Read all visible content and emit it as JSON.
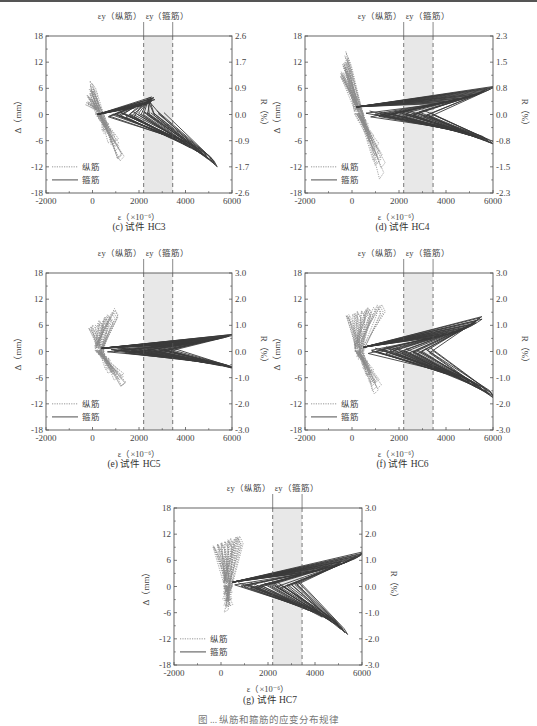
{
  "figure_caption": "图 ... 纵筋和箍筋的应变分布规律",
  "legend": {
    "long": "纵筋",
    "stirrup": "箍筋"
  },
  "annotations": {
    "yield_long": "εy（纵筋）",
    "yield_stirrup": "εy（箍筋）"
  },
  "axis_labels": {
    "x": "ε（×10⁻⁶）",
    "y_left": "Δ（mm）",
    "y_right": "R（%）"
  },
  "colors": {
    "stirrup": "#3a3a3a",
    "long": "#8a8a8a",
    "band": "#e8e8e8",
    "frame": "#555555"
  },
  "chart_data": [
    {
      "id": "c",
      "type": "line",
      "title": "(c) 试件 HC3",
      "xlabel": "ε（×10⁻⁶）",
      "ylabel": "Δ（mm）",
      "ylabel_right": "R（%）",
      "xlim": [
        -2000,
        6000
      ],
      "ylim": [
        -18,
        18
      ],
      "xticks": [
        -2000,
        0,
        2000,
        4000,
        6000
      ],
      "yticks": [
        -18,
        -12,
        -6,
        0,
        6,
        12,
        18
      ],
      "yticks_right": [
        "-2.6",
        "-1.7",
        "-0.9",
        "0.0",
        "0.9",
        "1.7",
        "2.6"
      ],
      "yield_lines": {
        "long": 2200,
        "stirrup": 3450
      },
      "series": [
        {
          "name": "纵筋",
          "style": "dotted",
          "envelope": [
            [
              -300,
              2
            ],
            [
              0,
              8
            ],
            [
              800,
              12
            ],
            [
              1200,
              -12
            ],
            [
              2000,
              -8
            ],
            [
              500,
              -2
            ]
          ]
        },
        {
          "name": "箍筋",
          "style": "solid",
          "envelope": [
            [
              200,
              0
            ],
            [
              2500,
              4
            ],
            [
              5600,
              12
            ],
            [
              5200,
              -12
            ],
            [
              3000,
              -8
            ],
            [
              600,
              0
            ]
          ]
        }
      ]
    },
    {
      "id": "d",
      "type": "line",
      "title": "(d) 试件 HC4",
      "xlabel": "ε（×10⁻⁶）",
      "ylabel": "Δ（mm）",
      "ylabel_right": "R（%）",
      "xlim": [
        -2000,
        6000
      ],
      "ylim": [
        -18,
        18
      ],
      "xticks": [
        -2000,
        0,
        2000,
        4000,
        6000
      ],
      "yticks": [
        -18,
        -12,
        -6,
        0,
        6,
        12,
        18
      ],
      "yticks_right": [
        "-2.3",
        "-1.5",
        "-0.8",
        "0.0",
        "0.8",
        "1.5",
        "2.3"
      ],
      "yield_lines": {
        "long": 2200,
        "stirrup": 3450
      },
      "series": [
        {
          "name": "纵筋",
          "style": "dotted",
          "envelope": [
            [
              -500,
              8
            ],
            [
              -200,
              15
            ],
            [
              200,
              -2
            ],
            [
              1200,
              -15
            ],
            [
              2200,
              -10
            ]
          ]
        },
        {
          "name": "箍筋",
          "style": "solid",
          "envelope": [
            [
              200,
              3.5
            ],
            [
              6000,
              6.5
            ],
            [
              3200,
              0
            ],
            [
              6000,
              -7
            ],
            [
              3600,
              -6
            ],
            [
              1500,
              -4
            ]
          ]
        }
      ]
    },
    {
      "id": "e",
      "type": "line",
      "title": "(e) 试件 HC5",
      "xlabel": "ε（×10⁻⁶）",
      "ylabel": "Δ（mm）",
      "ylabel_right": "R（%）",
      "xlim": [
        -2000,
        6000
      ],
      "ylim": [
        -18,
        18
      ],
      "xticks": [
        -2000,
        0,
        2000,
        4000,
        6000
      ],
      "yticks": [
        -18,
        -12,
        -6,
        0,
        6,
        12,
        18
      ],
      "yticks_right": [
        "-3.0",
        "-2.0",
        "-1.0",
        "0.0",
        "1.0",
        "2.0",
        "3.0"
      ],
      "yield_lines": {
        "long": 2200,
        "stirrup": 3450
      },
      "series": [
        {
          "name": "纵筋",
          "style": "dotted",
          "envelope": [
            [
              -200,
              5
            ],
            [
              1000,
              10
            ],
            [
              1900,
              -7
            ],
            [
              1300,
              -10
            ],
            [
              300,
              -2
            ]
          ]
        },
        {
          "name": "箍筋",
          "style": "solid",
          "envelope": [
            [
              400,
              1.5
            ],
            [
              6000,
              4
            ],
            [
              6000,
              -4
            ],
            [
              5400,
              -4
            ],
            [
              800,
              0
            ]
          ]
        }
      ]
    },
    {
      "id": "f",
      "type": "line",
      "title": "(f) 试件 HC6",
      "xlabel": "ε（×10⁻⁶）",
      "ylabel": "Δ（mm）",
      "ylabel_right": "R（%）",
      "xlim": [
        -2000,
        6000
      ],
      "ylim": [
        -18,
        18
      ],
      "xticks": [
        -2000,
        0,
        2000,
        4000,
        6000
      ],
      "yticks": [
        -18,
        -12,
        -6,
        0,
        6,
        12,
        18
      ],
      "yticks_right": [
        "-3.0",
        "-2.0",
        "-1.0",
        "0.0",
        "1.0",
        "2.0",
        "3.0"
      ],
      "yield_lines": {
        "long": 2200,
        "stirrup": 3450
      },
      "series": [
        {
          "name": "纵筋",
          "style": "dotted",
          "envelope": [
            [
              -400,
              8
            ],
            [
              1200,
              11
            ],
            [
              1900,
              -7
            ],
            [
              1000,
              -11
            ],
            [
              0,
              -1
            ]
          ]
        },
        {
          "name": "箍筋",
          "style": "solid",
          "envelope": [
            [
              500,
              2
            ],
            [
              5500,
              8
            ],
            [
              6000,
              7
            ],
            [
              6000,
              -11
            ],
            [
              4200,
              -8
            ],
            [
              800,
              0
            ]
          ]
        }
      ]
    },
    {
      "id": "g",
      "type": "line",
      "title": "(g) 试件 HC7",
      "xlabel": "ε（×10⁻⁶）",
      "ylabel": "Δ（mm）",
      "ylabel_right": "R（%）",
      "xlim": [
        -2000,
        6000
      ],
      "ylim": [
        -18,
        18
      ],
      "xticks": [
        -2000,
        0,
        2000,
        4000,
        6000
      ],
      "yticks": [
        -18,
        -12,
        -6,
        0,
        6,
        12,
        18
      ],
      "yticks_right": [
        "-3.0",
        "-2.0",
        "-1.0",
        "0.0",
        "1.0",
        "2.0",
        "3.0"
      ],
      "yield_lines": {
        "long": 2200,
        "stirrup": 3450
      },
      "series": [
        {
          "name": "纵筋",
          "style": "dotted",
          "envelope": [
            [
              -400,
              9
            ],
            [
              800,
              12
            ],
            [
              1700,
              -12
            ],
            [
              200,
              -6
            ],
            [
              0,
              0
            ]
          ]
        },
        {
          "name": "箍筋",
          "style": "solid",
          "envelope": [
            [
              500,
              2
            ],
            [
              6000,
              8
            ],
            [
              6000,
              -11
            ],
            [
              5300,
              -11
            ],
            [
              3900,
              -9
            ],
            [
              800,
              0
            ]
          ]
        }
      ]
    }
  ]
}
